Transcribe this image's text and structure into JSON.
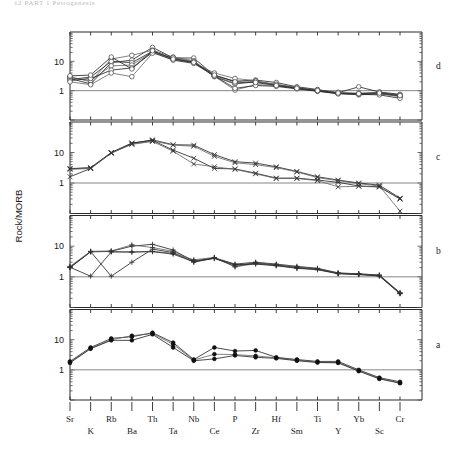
{
  "page": {
    "header_fragment": "12   PART 1   Petrogenesis",
    "figure_name": "spider-diagram-rock-morb"
  },
  "axes": {
    "ylabel": "Rock/MORB",
    "ytick_labels": [
      "10",
      "1"
    ],
    "ytick_values": [
      10,
      1
    ],
    "ylim": [
      0.1,
      100
    ],
    "reference_line_value": 1,
    "grid": false,
    "panel_labels": [
      "d",
      "c",
      "b",
      "a"
    ]
  },
  "chart_data": {
    "type": "line",
    "title": "",
    "subtitle": "",
    "xlabel": "",
    "ylabel": "Rock/MORB",
    "ylim": [
      0.1,
      100
    ],
    "yscale": "log",
    "ytick_values": [
      10,
      1
    ],
    "grid": false,
    "legend_position": "none",
    "categories": [
      "Sr",
      "K",
      "Rb",
      "Ba",
      "Th",
      "Ta",
      "Nb",
      "Ce",
      "P",
      "Zr",
      "Hf",
      "Sm",
      "Ti",
      "Y",
      "Yb",
      "Sc",
      "Cr"
    ],
    "categories_row_top": [
      "Sr",
      "Rb",
      "Th",
      "Nb",
      "P",
      "Hf",
      "Ti",
      "Yb",
      "Cr"
    ],
    "categories_row_bottom": [
      "K",
      "Ba",
      "Ta",
      "Ce",
      "Zr",
      "Sm",
      "Y",
      "Sc"
    ],
    "panels": [
      {
        "label": "d",
        "marker": "open-circle",
        "annotation": "",
        "series": [
          {
            "name": "d1",
            "values": [
              2.6,
              1.7,
              9.0,
              11.0,
              30.0,
              13.0,
              13.0,
              3.3,
              2.1,
              2.3,
              1.9,
              1.35,
              1.1,
              0.82,
              0.72,
              0.78,
              0.66
            ]
          },
          {
            "name": "d2",
            "values": [
              3.0,
              2.0,
              12.0,
              16.0,
              24.0,
              14.0,
              10.5,
              3.1,
              1.05,
              1.6,
              1.5,
              1.2,
              1.0,
              0.8,
              0.8,
              0.85,
              0.72
            ]
          },
          {
            "name": "d3",
            "values": [
              2.4,
              2.9,
              10.0,
              9.0,
              22.0,
              12.5,
              9.5,
              3.0,
              1.7,
              2.0,
              1.6,
              1.25,
              1.0,
              0.85,
              1.35,
              0.9,
              0.75
            ]
          },
          {
            "name": "d4",
            "values": [
              2.8,
              2.2,
              7.0,
              7.5,
              21.0,
              11.5,
              9.0,
              4.0,
              2.6,
              2.2,
              1.55,
              1.2,
              0.98,
              0.8,
              0.78,
              0.8,
              0.62
            ]
          },
          {
            "name": "d5",
            "values": [
              2.2,
              2.6,
              5.0,
              6.0,
              20.0,
              11.0,
              8.5,
              3.2,
              1.2,
              1.5,
              1.4,
              1.15,
              0.95,
              0.78,
              0.75,
              0.72,
              0.55
            ]
          },
          {
            "name": "d6",
            "values": [
              2.0,
              1.6,
              4.0,
              3.0,
              19.0,
              13.5,
              9.8,
              3.1,
              1.8,
              2.1,
              1.65,
              1.3,
              1.05,
              0.88,
              0.82,
              0.88,
              0.7
            ]
          },
          {
            "name": "d7",
            "values": [
              3.2,
              3.4,
              14.0,
              5.5,
              23.0,
              12.0,
              9.2,
              3.4,
              2.0,
              1.9,
              1.5,
              1.2,
              1.0,
              0.83,
              0.79,
              0.83,
              0.68
            ]
          }
        ]
      },
      {
        "label": "c",
        "marker": "cross",
        "annotation": "",
        "series": [
          {
            "name": "c1",
            "values": [
              1.6,
              3.0,
              9.5,
              20.0,
              26.0,
              18.0,
              17.5,
              8.5,
              5.0,
              4.5,
              3.4,
              2.4,
              1.6,
              1.25,
              1.0,
              0.85,
              0.32
            ]
          },
          {
            "name": "c2",
            "values": [
              3.0,
              3.1,
              9.8,
              19.0,
              24.0,
              17.5,
              16.0,
              7.5,
              4.6,
              4.0,
              3.2,
              2.3,
              1.5,
              1.2,
              0.95,
              0.8,
              0.12
            ]
          },
          {
            "name": "c3",
            "values": [
              2.9,
              3.2,
              10.0,
              20.5,
              25.0,
              12.0,
              6.5,
              3.0,
              2.9,
              2.1,
              1.45,
              1.45,
              1.25,
              1.05,
              0.8,
              0.75,
              0.3
            ]
          },
          {
            "name": "c4",
            "values": [
              2.8,
              3.0,
              9.6,
              18.5,
              23.0,
              11.0,
              4.2,
              3.4,
              2.8,
              2.0,
              1.4,
              1.4,
              1.2,
              0.75,
              0.78,
              0.74,
              0.3
            ]
          }
        ]
      },
      {
        "label": "b",
        "marker": "plus",
        "annotation": "",
        "series": [
          {
            "name": "b1",
            "values": [
              2.0,
              6.5,
              6.8,
              10.0,
              11.5,
              7.5,
              3.2,
              4.2,
              2.6,
              3.0,
              2.6,
              2.2,
              1.9,
              1.35,
              1.25,
              1.15,
              0.3
            ]
          },
          {
            "name": "b2",
            "values": [
              2.1,
              6.8,
              7.0,
              11.0,
              9.0,
              6.8,
              3.4,
              4.0,
              2.4,
              2.9,
              2.5,
              2.1,
              1.85,
              1.3,
              1.25,
              1.12,
              0.3
            ]
          },
          {
            "name": "b3",
            "values": [
              2.0,
              6.6,
              1.05,
              3.0,
              8.0,
              6.2,
              3.0,
              4.1,
              2.2,
              2.8,
              2.4,
              2.0,
              1.8,
              1.3,
              1.22,
              1.1,
              0.29
            ]
          },
          {
            "name": "b4",
            "values": [
              2.2,
              6.7,
              6.6,
              6.5,
              6.8,
              5.8,
              3.6,
              4.3,
              2.1,
              2.7,
              2.35,
              1.95,
              1.75,
              1.28,
              1.2,
              1.08,
              0.29
            ]
          },
          {
            "name": "b5",
            "values": [
              2.05,
              1.05,
              6.5,
              6.4,
              6.6,
              5.5,
              3.1,
              4.0,
              2.5,
              2.6,
              2.3,
              1.9,
              1.7,
              1.26,
              1.18,
              1.06,
              0.28
            ]
          }
        ]
      },
      {
        "label": "a",
        "marker": "solid-circle",
        "annotation": "",
        "series": [
          {
            "name": "a1",
            "values": [
              1.9,
              5.5,
              11.0,
              12.5,
              17.0,
              8.0,
              2.2,
              5.5,
              4.2,
              4.4,
              2.6,
              2.2,
              1.9,
              1.9,
              1.0,
              0.55,
              0.4
            ]
          },
          {
            "name": "a2",
            "values": [
              1.8,
              5.2,
              10.0,
              13.5,
              16.0,
              7.0,
              2.1,
              3.3,
              3.2,
              2.9,
              2.5,
              2.1,
              1.8,
              1.75,
              0.95,
              0.52,
              0.37
            ]
          },
          {
            "name": "a3",
            "values": [
              1.7,
              5.0,
              9.5,
              9.5,
              15.0,
              5.5,
              2.0,
              2.3,
              3.0,
              2.6,
              2.4,
              2.0,
              1.75,
              1.7,
              0.9,
              0.5,
              0.36
            ]
          }
        ]
      }
    ]
  }
}
